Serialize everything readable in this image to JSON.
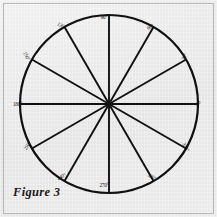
{
  "figure": {
    "caption": "Figure 3",
    "type": "protractor-circle-diagram",
    "background_color": "#ececec",
    "ink_color": "#111111",
    "frame_color": "#b9b9b9"
  },
  "chart_data": {
    "type": "scatter",
    "title": "Figure 3",
    "subtitle": "",
    "xlabel": "",
    "ylabel": "",
    "grid": false,
    "legend": "none",
    "circle": {
      "center_x": 109,
      "center_y": 104,
      "radius": 89,
      "stroke_width": 2.2
    },
    "sector_count": 12,
    "sector_angle_deg": 30,
    "diameter_count": 6,
    "categories": [
      "0°",
      "30°",
      "60°",
      "90°",
      "120°",
      "150°",
      "180°",
      "210°",
      "240°",
      "270°",
      "300°",
      "330°"
    ],
    "values": [
      0,
      30,
      60,
      90,
      120,
      150,
      180,
      210,
      240,
      270,
      300,
      330
    ],
    "xlim": [
      -1,
      1
    ],
    "ylim": [
      -1,
      1
    ],
    "points": [
      {
        "label": "0°",
        "angle": 0,
        "lx": 196,
        "ly": 105,
        "rot": 0,
        "anchor": "left"
      },
      {
        "label": "30°",
        "angle": 30,
        "lx": 181,
        "ly": 57,
        "rot": -62,
        "anchor": "left"
      },
      {
        "label": "60°",
        "angle": 60,
        "lx": 147,
        "ly": 27,
        "rot": -30,
        "anchor": "left"
      },
      {
        "label": "90°",
        "angle": 90,
        "lx": 104,
        "ly": 18,
        "rot": 0,
        "anchor": "center"
      },
      {
        "label": "120°",
        "angle": 120,
        "lx": 66,
        "ly": 26,
        "rot": 28,
        "anchor": "right"
      },
      {
        "label": "150°",
        "angle": 150,
        "lx": 31,
        "ly": 56,
        "rot": 62,
        "anchor": "right"
      },
      {
        "label": "180°",
        "angle": 180,
        "lx": 22,
        "ly": 105,
        "rot": 0,
        "anchor": "right"
      },
      {
        "label": "210°",
        "angle": 210,
        "lx": 32,
        "ly": 146,
        "rot": -60,
        "anchor": "right"
      },
      {
        "label": "240°",
        "angle": 240,
        "lx": 66,
        "ly": 177,
        "rot": -28,
        "anchor": "right"
      },
      {
        "label": "270°",
        "angle": 270,
        "lx": 104,
        "ly": 186,
        "rot": 0,
        "anchor": "center"
      },
      {
        "label": "300°",
        "angle": 300,
        "lx": 147,
        "ly": 177,
        "rot": 28,
        "anchor": "left"
      },
      {
        "label": "330°",
        "angle": 330,
        "lx": 181,
        "ly": 147,
        "rot": 60,
        "anchor": "left"
      }
    ]
  }
}
